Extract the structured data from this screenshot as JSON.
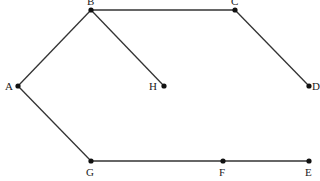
{
  "diagram": {
    "type": "graph",
    "nodes": [
      {
        "id": "A",
        "label": "A",
        "x": 18,
        "y": 86,
        "lx": 5,
        "ly": 90
      },
      {
        "id": "B",
        "label": "B",
        "x": 91,
        "y": 10,
        "lx": 87,
        "ly": 5
      },
      {
        "id": "C",
        "label": "C",
        "x": 235,
        "y": 10,
        "lx": 231,
        "ly": 5
      },
      {
        "id": "D",
        "label": "D",
        "x": 309,
        "y": 86,
        "lx": 312,
        "ly": 90
      },
      {
        "id": "E",
        "label": "E",
        "x": 309,
        "y": 161,
        "lx": 305,
        "ly": 176
      },
      {
        "id": "F",
        "label": "F",
        "x": 223,
        "y": 161,
        "lx": 219,
        "ly": 176
      },
      {
        "id": "G",
        "label": "G",
        "x": 91,
        "y": 161,
        "lx": 86,
        "ly": 176
      },
      {
        "id": "H",
        "label": "H",
        "x": 164,
        "y": 86,
        "lx": 149,
        "ly": 90
      }
    ],
    "edges": [
      {
        "from": "A",
        "to": "B"
      },
      {
        "from": "B",
        "to": "C"
      },
      {
        "from": "C",
        "to": "D"
      },
      {
        "from": "B",
        "to": "H"
      },
      {
        "from": "A",
        "to": "G"
      },
      {
        "from": "G",
        "to": "F"
      },
      {
        "from": "F",
        "to": "E"
      }
    ]
  }
}
